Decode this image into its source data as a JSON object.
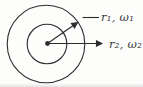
{
  "figure": {
    "labels": {
      "top": "r₁, ω₁",
      "bottom": "r₂, ω₂"
    },
    "colors": {
      "line": "#2d2d2d",
      "text": "#3a3a3a",
      "background": "#fdfdfc"
    }
  }
}
